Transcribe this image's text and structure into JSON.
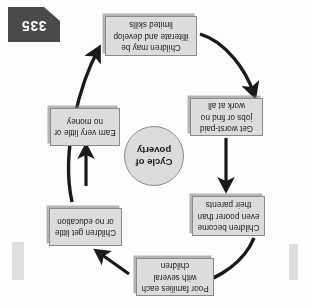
{
  "page": {
    "number": "335",
    "background_color": "#fdfdfc"
  },
  "diagram": {
    "title": "Cycle of poverty",
    "center_label_line1": "Cycle of",
    "center_label_line2": "poverty",
    "orientation_note": "page reproduced upside-down",
    "box_fill_color": "#dcdcdc",
    "box_border_color": "#8a8a8a",
    "arrow_color": "#1a1a1a",
    "nodes": [
      {
        "id": "families",
        "label": "Poor families each with several children"
      },
      {
        "id": "education",
        "label": "Children get little or no education"
      },
      {
        "id": "skills",
        "label": "Children may be illiterate and develop limited skills"
      },
      {
        "id": "jobs",
        "label": "Get worst-paid jobs or find no work at all"
      },
      {
        "id": "money",
        "label": "Earn very little or no money"
      },
      {
        "id": "poorer",
        "label": "Children become even poorer than their parents"
      }
    ],
    "flow": [
      {
        "from": "families",
        "to": "education",
        "style": "straight"
      },
      {
        "from": "education",
        "to": "skills",
        "style": "curved"
      },
      {
        "from": "skills",
        "to": "jobs",
        "style": "curved"
      },
      {
        "from": "jobs",
        "to": "money",
        "style": "straight"
      },
      {
        "from": "money",
        "to": "poorer",
        "style": "curved"
      },
      {
        "from": "poorer",
        "to": "families",
        "style": "curved"
      }
    ]
  }
}
